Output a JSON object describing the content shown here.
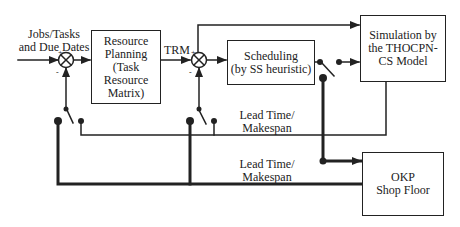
{
  "diagram": {
    "input_label": "Jobs/Tasks\nand Due Dates",
    "input_label_lines": [
      "Jobs/Tasks",
      "and Due Dates"
    ],
    "blocks": {
      "resource_planning": [
        "Resource",
        "Planning",
        "(Task",
        "Resource",
        "Matrix)"
      ],
      "scheduling": [
        "Scheduling",
        "(by SS heuristic)"
      ],
      "simulation": [
        "Simulation by",
        "the  THOCPN-",
        "CS Model"
      ],
      "shop_floor": [
        "OKP",
        "Shop Floor"
      ]
    },
    "signals": {
      "trm": "TRM",
      "feedback_sim": [
        "Lead Time/",
        "Makespan"
      ],
      "feedback_shop": [
        "Lead Time/",
        "Makespan"
      ]
    },
    "junction_signs": {
      "plus": "+",
      "minus": "-"
    },
    "colors": {
      "line": "#222222",
      "background": "#ffffff"
    }
  }
}
